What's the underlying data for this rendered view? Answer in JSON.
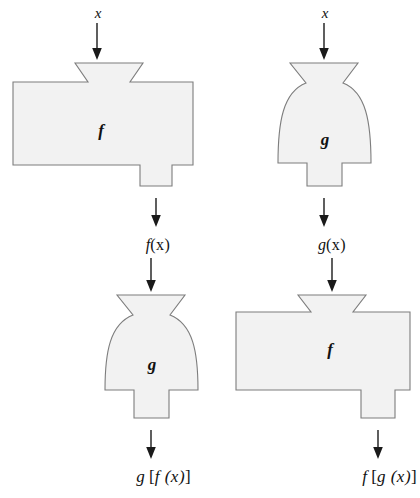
{
  "figure": {
    "type": "diagram",
    "fill_color": "#f2f2f2",
    "stroke_color": "#7d7d7d",
    "arrow_color": "#1a1a1a"
  },
  "columns": [
    {
      "name": "left-column",
      "input_label": "x",
      "first_machine": {
        "label": "f",
        "shape": "rectangular-box"
      },
      "intermediate_label": "f(x)",
      "second_machine": {
        "label": "g",
        "shape": "bell-dome"
      },
      "output_label": "g [ f (x) ]"
    },
    {
      "name": "right-column",
      "input_label": "x",
      "first_machine": {
        "label": "g",
        "shape": "bell-dome"
      },
      "intermediate_label": "g (x)",
      "second_machine": {
        "label": "f",
        "shape": "rectangular-box"
      },
      "output_label": "f [ g (x) ]"
    }
  ],
  "labels": {
    "input_left": "x",
    "input_right": "x",
    "machine_1_left": "f",
    "machine_1_right": "g",
    "mid_left": "f",
    "mid_left_arg": "(x)",
    "mid_right": "g",
    "mid_right_arg": "(x)",
    "machine_2_left": "g",
    "machine_2_right": "f",
    "out_left_outer": "g",
    "out_left_inner": "f (x)",
    "out_right_outer": "f",
    "out_right_inner": "g (x)"
  },
  "arrows": [
    {
      "name": "arrow-x-to-f",
      "from": "x",
      "to": "f machine"
    },
    {
      "name": "arrow-f-to-fx",
      "from": "f machine",
      "to": "f(x)"
    },
    {
      "name": "arrow-fx-to-g",
      "from": "f(x)",
      "to": "g machine"
    },
    {
      "name": "arrow-g-to-gfx",
      "from": "g machine",
      "to": "g[f(x)]"
    },
    {
      "name": "arrow-x-to-g",
      "from": "x",
      "to": "g machine"
    },
    {
      "name": "arrow-g-to-gx",
      "from": "g machine",
      "to": "g(x)"
    },
    {
      "name": "arrow-gx-to-f",
      "from": "g(x)",
      "to": "f machine"
    },
    {
      "name": "arrow-f-to-fgx",
      "from": "f machine",
      "to": "f[g(x)]"
    }
  ]
}
